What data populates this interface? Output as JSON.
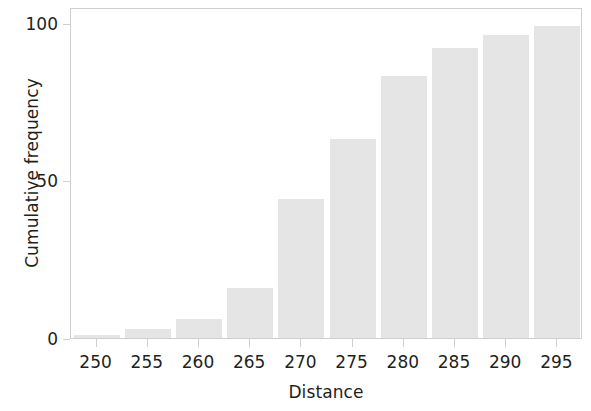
{
  "chart_data": {
    "type": "bar",
    "title": "",
    "subtitle": "",
    "xlabel": "Distance",
    "ylabel": "Cumulative frequency",
    "categories": [
      "250",
      "255",
      "260",
      "265",
      "270",
      "275",
      "280",
      "285",
      "290",
      "295"
    ],
    "values": [
      1,
      3,
      6,
      16,
      44,
      63,
      83,
      92,
      96,
      99
    ],
    "xticklabels": [
      "250",
      "255",
      "260",
      "265",
      "270",
      "275",
      "280",
      "285",
      "290",
      "295"
    ],
    "yticklabels": [
      "0",
      "50",
      "100"
    ],
    "ytickvalues": [
      0,
      50,
      100
    ],
    "ylim": [
      0,
      105
    ],
    "xlim": [
      247.5,
      297.5
    ],
    "grid": false,
    "legend": false,
    "legend_position": "none",
    "bar_color": "#e5e5e5",
    "axis_color": "#cfcfcf",
    "text_color": "#231f20",
    "background_color": "#ffffff"
  },
  "axes": {
    "y_title": "Cumulative frequency",
    "x_title": "Distance"
  }
}
